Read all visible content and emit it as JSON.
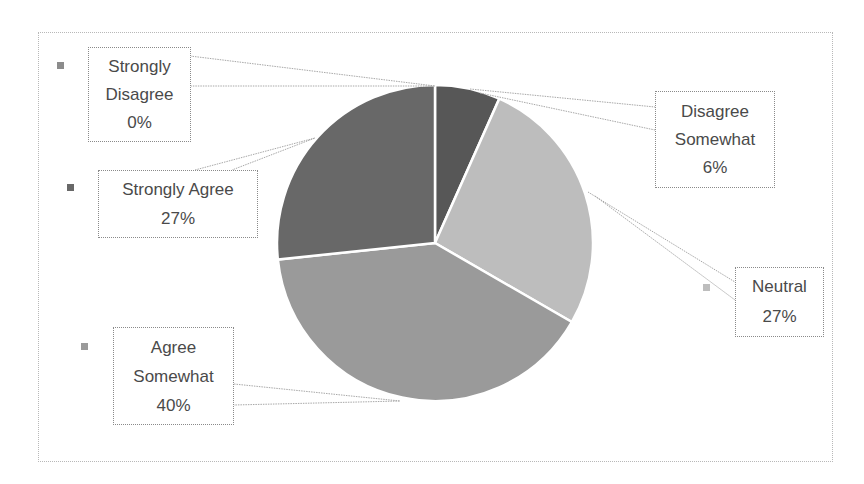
{
  "chart_data": {
    "type": "pie",
    "title": "",
    "legend_position": "none (markers beside data labels)",
    "start_angle_deg": 0,
    "direction": "clockwise",
    "categories": [
      "Strongly Disagree",
      "Disagree Somewhat",
      "Neutral",
      "Agree Somewhat",
      "Strongly Agree"
    ],
    "values": [
      0,
      6.67,
      26.67,
      40,
      26.67
    ],
    "labels": [
      "0%",
      "6%",
      "27%",
      "40%",
      "27%"
    ],
    "colors": [
      "#8c8c8c",
      "#575757",
      "#bdbdbd",
      "#9a9a9a",
      "#686868"
    ],
    "data_labels": [
      {
        "line1": "Strongly",
        "line2": "Disagree",
        "pct": "0%"
      },
      {
        "line1": "Disagree",
        "line2": "Somewhat",
        "pct": "6%"
      },
      {
        "line1": "Neutral",
        "line2": "",
        "pct": "27%"
      },
      {
        "line1": "Agree",
        "line2": "Somewhat",
        "pct": "40%"
      },
      {
        "line1": "Strongly Agree",
        "line2": "",
        "pct": "27%"
      }
    ]
  }
}
